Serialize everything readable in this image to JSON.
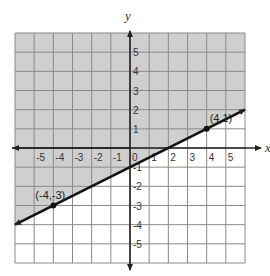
{
  "graph": {
    "x_axis_label": "x",
    "y_axis_label": "y",
    "x_range": [
      -6,
      6
    ],
    "y_range": [
      -6,
      6
    ],
    "x_tick_labels": [
      "-5",
      "-4",
      "-3",
      "-2",
      "-1",
      "0",
      "1",
      "2",
      "3",
      "4",
      "5"
    ],
    "y_tick_labels": [
      "5",
      "4",
      "3",
      "2",
      "1",
      "-1",
      "-2",
      "-3",
      "-4",
      "-5"
    ],
    "grid": true,
    "shaded_region": "above line",
    "shade_color": "#cfcfcf",
    "grid_color": "#8a8a8a",
    "line_color": "#111111",
    "line": {
      "style": "solid",
      "equation": "y = 0.5x - 1",
      "slope": 0.5,
      "y_intercept": -1
    },
    "points": [
      {
        "label": "(-4,-3)",
        "x": -4,
        "y": -3
      },
      {
        "label": "(4,1)",
        "x": 4,
        "y": 1
      }
    ]
  },
  "chart_data": {
    "type": "line",
    "title": "",
    "xlabel": "x",
    "ylabel": "y",
    "xlim": [
      -6,
      6
    ],
    "ylim": [
      -6,
      6
    ],
    "grid": true,
    "series": [
      {
        "name": "boundary line y = 0.5x - 1",
        "x": [
          -6,
          -4,
          4,
          6
        ],
        "y": [
          -4,
          -3,
          1,
          2
        ]
      }
    ],
    "annotations": [
      "(-4,-3)",
      "(4,1)"
    ],
    "shading": "region above y = 0.5x - 1 shaded gray (y >= 0.5x - 1)"
  }
}
